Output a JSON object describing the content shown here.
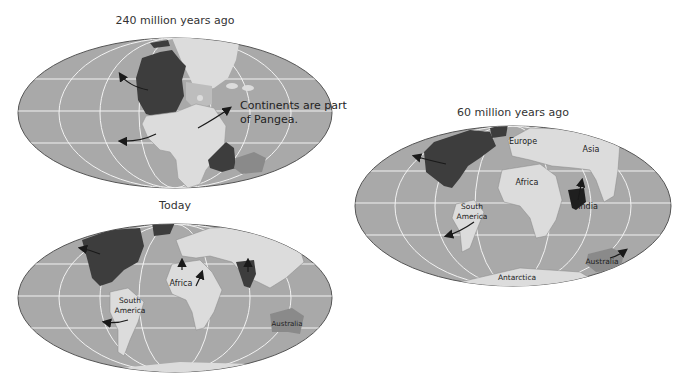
{
  "colors": {
    "ocean": "#a9a9a9",
    "ocean_edge": "#555555",
    "grid": "#f2f2f2",
    "land_light": "#dcdcdc",
    "land_mid": "#8a8a8a",
    "land_dark": "#3d3d3d",
    "land_shelf": "#bdbdbd",
    "arrow": "#1a1a1a",
    "text": "#333333"
  },
  "maps": [
    {
      "id": "240mya",
      "title": "240 million years ago",
      "annotation_line1": "Continents are part",
      "annotation_line2": "of Pangea."
    },
    {
      "id": "today",
      "title": "Today",
      "labels": {
        "africa": "Africa",
        "south_america_1": "South",
        "south_america_2": "America",
        "australia": "Australia"
      }
    },
    {
      "id": "60mya",
      "title": "60 million years ago",
      "labels": {
        "europe": "Europe",
        "asia": "Asia",
        "africa": "Africa",
        "india": "India",
        "south_america_1": "South",
        "south_america_2": "America",
        "australia": "Australia",
        "antarctica": "Antarctica"
      }
    }
  ]
}
